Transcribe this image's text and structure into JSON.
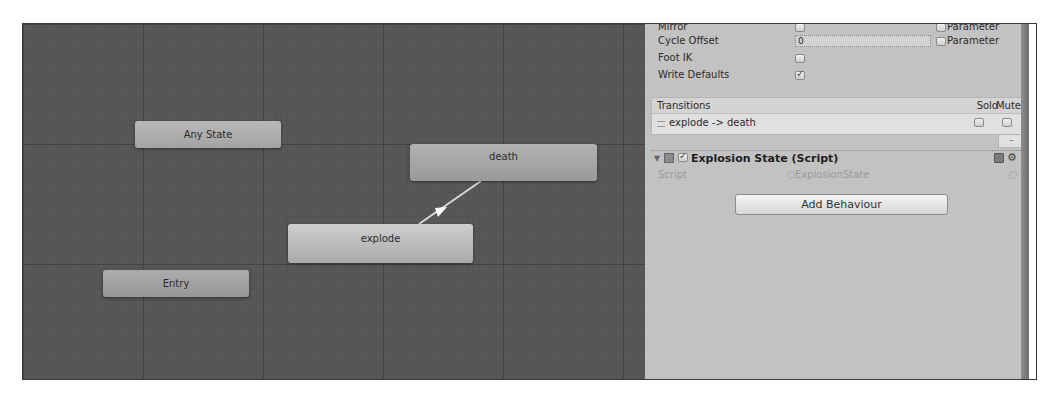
{
  "graph": {
    "nodes": {
      "any_state": "Any State",
      "entry": "Entry",
      "death": "death",
      "explode": "explode"
    },
    "transition": {
      "from": "explode",
      "to": "death"
    }
  },
  "inspector": {
    "properties": {
      "mirror": {
        "label": "Mirror",
        "checked": false,
        "parameter_label": "Parameter"
      },
      "cycle_offset": {
        "label": "Cycle Offset",
        "value": "0",
        "parameter_label": "Parameter"
      },
      "foot_ik": {
        "label": "Foot IK",
        "checked": false
      },
      "write_defaults": {
        "label": "Write Defaults",
        "checked": true
      }
    },
    "transitions": {
      "header": "Transitions",
      "solo_label": "Solo",
      "mute_label": "Mute",
      "items": [
        {
          "label": "explode -> death",
          "solo": false,
          "mute": false
        }
      ],
      "remove_label": "–"
    },
    "component": {
      "title": "Explosion State (Script)",
      "enabled": true,
      "script_label": "Script",
      "script_value": "ExplosionState",
      "foldout_icon": "▼",
      "gear_icon": "⚙"
    },
    "add_behaviour_label": "Add Behaviour"
  }
}
